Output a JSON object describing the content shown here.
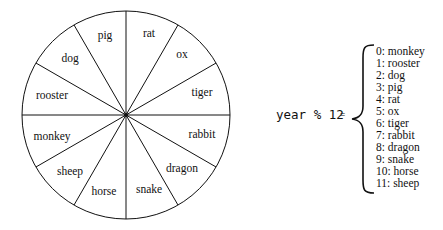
{
  "wheel": {
    "segments_clockwise_from_top": [
      "rat",
      "ox",
      "tiger",
      "rabbit",
      "dragon",
      "snake",
      "horse",
      "sheep",
      "monkey",
      "rooster",
      "dog",
      "pig"
    ]
  },
  "formula": {
    "expression": "year % 12",
    "equals": "="
  },
  "mapping": [
    {
      "label": "0: monkey"
    },
    {
      "label": "1: rooster"
    },
    {
      "label": "2: dog"
    },
    {
      "label": "3: pig"
    },
    {
      "label": "4: rat"
    },
    {
      "label": "5: ox"
    },
    {
      "label": "6: tiger"
    },
    {
      "label": "7: rabbit"
    },
    {
      "label": "8: dragon"
    },
    {
      "label": "9: snake"
    },
    {
      "label": "10: horse"
    },
    {
      "label": "11: sheep"
    }
  ]
}
